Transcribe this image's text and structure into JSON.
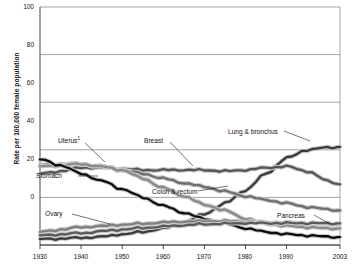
{
  "chart_data": {
    "type": "line",
    "title": "",
    "xlabel": "",
    "ylabel": "Rate per 100,000 female population",
    "xlim": [
      1930,
      2003
    ],
    "ylim": [
      0,
      100
    ],
    "grid": true,
    "legend": "annotations-inline",
    "yticks": [
      0,
      20,
      40,
      60,
      80,
      100
    ],
    "xticks": [
      1930,
      1940,
      1950,
      1960,
      1970,
      1980,
      1990,
      2003
    ],
    "x": [
      1930,
      1935,
      1940,
      1945,
      1950,
      1955,
      1960,
      1965,
      1970,
      1975,
      1980,
      1985,
      1990,
      1995,
      2000,
      2003
    ],
    "series": [
      {
        "name": "Lung & bronchus",
        "color": "#3b3b3b",
        "values": [
          2.5,
          2.7,
          3.0,
          3.5,
          4.5,
          5.5,
          7.0,
          9.5,
          13.0,
          17.5,
          23.0,
          30.0,
          36.5,
          40.0,
          41.0,
          41.2
        ]
      },
      {
        "name": "Breast",
        "color": "#555555",
        "values": [
          30.0,
          31.0,
          32.5,
          32.5,
          32.0,
          31.5,
          31.5,
          31.5,
          31.5,
          31.0,
          31.5,
          32.5,
          33.0,
          31.0,
          27.0,
          25.5
        ]
      },
      {
        "name": "Colon & rectum",
        "color": "#6e6e6e",
        "values": [
          33.5,
          34.0,
          34.0,
          33.0,
          31.5,
          30.0,
          28.0,
          26.0,
          24.5,
          22.5,
          20.5,
          19.0,
          17.5,
          16.0,
          15.0,
          14.5
        ]
      },
      {
        "name": "Uterus",
        "color": "#8a8a8a",
        "values": [
          33.0,
          33.5,
          34.0,
          33.0,
          31.5,
          28.0,
          24.0,
          20.5,
          17.0,
          14.5,
          11.0,
          9.0,
          8.0,
          7.5,
          7.0,
          7.0
        ]
      },
      {
        "name": "Stomach",
        "color": "#0d0d0d",
        "values": [
          36.0,
          33.5,
          30.0,
          27.0,
          23.5,
          20.0,
          16.5,
          13.5,
          11.0,
          9.0,
          7.0,
          5.5,
          4.5,
          4.0,
          3.5,
          3.3
        ]
      },
      {
        "name": "Ovary",
        "color": "#7f7f7f",
        "values": [
          5.5,
          6.5,
          7.5,
          8.0,
          8.5,
          9.0,
          9.5,
          9.8,
          10.0,
          10.0,
          9.8,
          9.5,
          9.3,
          9.2,
          9.0,
          8.8
        ]
      },
      {
        "name": "Pancreas",
        "color": "#5a5a5a",
        "values": [
          4.0,
          4.5,
          5.0,
          5.8,
          6.5,
          7.2,
          7.8,
          8.3,
          8.8,
          9.0,
          9.2,
          9.2,
          9.2,
          9.2,
          9.1,
          9.1
        ]
      }
    ],
    "annotations": [
      {
        "id": "uterus",
        "label": "Uterus",
        "footnote": "1"
      },
      {
        "id": "breast",
        "label": "Breast",
        "footnote": ""
      },
      {
        "id": "lung-bronchus",
        "label": "Lung & bronchus",
        "footnote": ""
      },
      {
        "id": "stomach",
        "label": "Stomach",
        "footnote": ""
      },
      {
        "id": "colon-rectum",
        "label": "Colon & rectum",
        "footnote": ""
      },
      {
        "id": "ovary",
        "label": "Ovary",
        "footnote": ""
      },
      {
        "id": "pancreas",
        "label": "Pancreas",
        "footnote": ""
      }
    ]
  },
  "axis": {
    "y_tick_0": "0",
    "y_tick_20": "20",
    "y_tick_40": "40",
    "y_tick_60": "60",
    "y_tick_80": "80",
    "y_tick_100": "100",
    "x_tick_1930": "1930",
    "x_tick_1940": "1940",
    "x_tick_1950": "1950",
    "x_tick_1960": "1960",
    "x_tick_1970": "1970",
    "x_tick_1980": "1980",
    "x_tick_1990": "1990",
    "x_tick_2003": "2003",
    "y_axis_title": "Rate per 100,000 female population"
  },
  "labels": {
    "uterus": "Uterus",
    "uterus_fn": "1",
    "breast": "Breast",
    "lung": "Lung & bronchus",
    "stomach": "Stomach",
    "colon": "Colon & rectum",
    "ovary": "Ovary",
    "pancreas": "Pancreas"
  }
}
